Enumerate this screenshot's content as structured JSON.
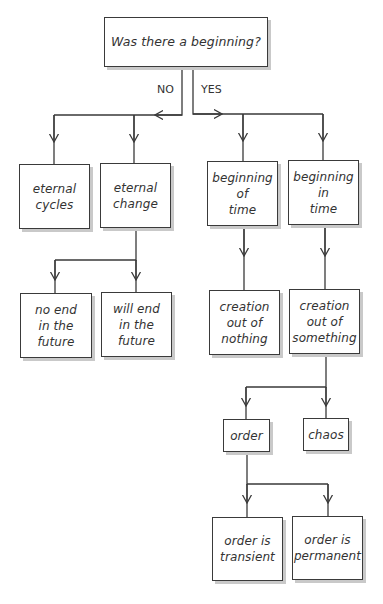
{
  "diagram": {
    "title_question": "Was there a beginning?",
    "branch_labels": {
      "no": "NO",
      "yes": "YES"
    },
    "nodes": {
      "root": "Was there a beginning?",
      "eternal_cycles": "eternal\ncycles",
      "eternal_change": "eternal\nchange",
      "no_end_future": "no end\nin the\nfuture",
      "will_end_future": "will end\nin the\nfuture",
      "beginning_of_time": "beginning\nof\ntime",
      "beginning_in_time": "beginning\nin\ntime",
      "creation_nothing": "creation\nout of\nnothing",
      "creation_something": "creation\nout of\nsomething",
      "order": "order",
      "chaos": "chaos",
      "order_transient": "order is\ntransient",
      "order_permanent": "order is\npermanent"
    },
    "edges": [
      [
        "root",
        "eternal_cycles",
        "NO"
      ],
      [
        "root",
        "eternal_change",
        "NO"
      ],
      [
        "root",
        "beginning_of_time",
        "YES"
      ],
      [
        "root",
        "beginning_in_time",
        "YES"
      ],
      [
        "eternal_change",
        "no_end_future"
      ],
      [
        "eternal_change",
        "will_end_future"
      ],
      [
        "beginning_of_time",
        "creation_nothing"
      ],
      [
        "beginning_in_time",
        "creation_something"
      ],
      [
        "creation_something",
        "order"
      ],
      [
        "creation_something",
        "chaos"
      ],
      [
        "order",
        "order_transient"
      ],
      [
        "order",
        "order_permanent"
      ]
    ],
    "colors": {
      "line": "#3a3a3a",
      "shadow": "#c9c9c9",
      "text": "#333333"
    }
  }
}
